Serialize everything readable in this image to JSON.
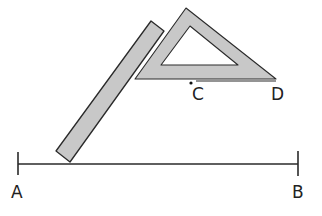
{
  "diagram": {
    "colors": {
      "background": "#ffffff",
      "stroke": "#2a2a2a",
      "tool_fill": "#c8c8c8"
    },
    "line_ab": {
      "x1": 18,
      "y1": 164,
      "x2": 298,
      "y2": 164,
      "tick_a": {
        "x": 18,
        "y1": 152,
        "y2": 175
      },
      "tick_b": {
        "x": 298,
        "y1": 151,
        "y2": 176
      }
    },
    "line_cd": {
      "x1": 196,
      "y1": 81,
      "x2": 276,
      "y2": 81
    },
    "point_c": {
      "cx": 191,
      "cy": 83,
      "r": 1.6
    },
    "ruler": {
      "points": "56,151 70,162 164,31 151,21"
    },
    "set_square": {
      "outer": "186,8 135,79 276,79",
      "inner": "190,26 161,65 238,65"
    },
    "labels": [
      {
        "id": "A",
        "text": "A",
        "x": 11,
        "y": 198
      },
      {
        "id": "B",
        "text": "B",
        "x": 292,
        "y": 198
      },
      {
        "id": "C",
        "text": "C",
        "x": 192,
        "y": 100
      },
      {
        "id": "D",
        "text": "D",
        "x": 271,
        "y": 100
      }
    ]
  }
}
